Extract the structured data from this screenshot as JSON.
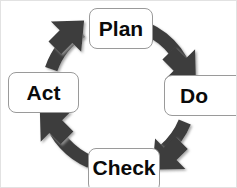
{
  "diagram": {
    "type": "pdca-cycle",
    "direction": "clockwise",
    "colors": {
      "arrow": "#3d3d3d",
      "arrow_shadow": "#8d8d8d",
      "box_fill": "#ffffff",
      "box_border": "#9a9a9a",
      "text": "#0a0a0a",
      "background": "#ffffff"
    },
    "geometry": {
      "center_x": 117,
      "center_y": 94,
      "radius": 72,
      "stroke_width": 13
    },
    "nodes": [
      {
        "id": "plan",
        "label": "Plan",
        "position": "top"
      },
      {
        "id": "do",
        "label": "Do",
        "position": "right"
      },
      {
        "id": "check",
        "label": "Check",
        "position": "bottom"
      },
      {
        "id": "act",
        "label": "Act",
        "position": "left"
      }
    ],
    "arrows": [
      {
        "id": "plan-to-do",
        "from": "plan",
        "to": "do",
        "head": "south-east"
      },
      {
        "id": "do-to-check",
        "from": "do",
        "to": "check",
        "head": "south-west"
      },
      {
        "id": "check-to-act",
        "from": "check",
        "to": "act",
        "head": "north-west"
      },
      {
        "id": "act-to-plan",
        "from": "act",
        "to": "plan",
        "head": "north-east"
      }
    ]
  }
}
